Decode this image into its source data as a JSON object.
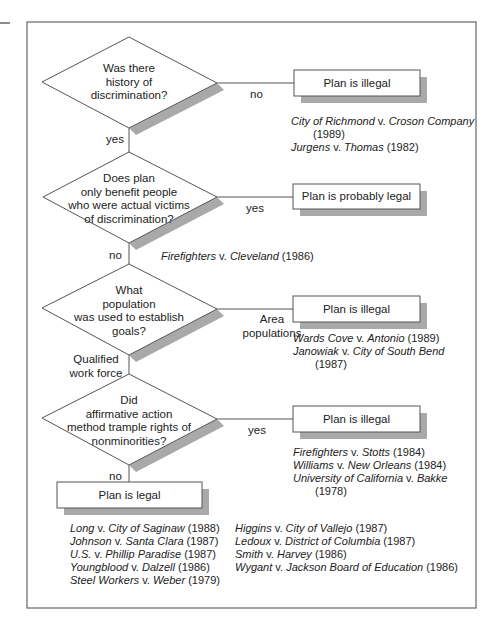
{
  "diagram": {
    "decisions": [
      {
        "id": "d1",
        "lines": [
          "Was there",
          "history of",
          "discrimination?"
        ]
      },
      {
        "id": "d2",
        "lines": [
          "Does plan",
          "only benefit people",
          "who were actual victims",
          "of discrimination?"
        ]
      },
      {
        "id": "d3",
        "lines": [
          "What",
          "population",
          "was used to establish",
          "goals?"
        ]
      },
      {
        "id": "d4",
        "lines": [
          "Did",
          "affirmative action",
          "method trample rights of",
          "nonminorities?"
        ]
      }
    ],
    "outcomes": [
      {
        "id": "o1",
        "label": "Plan is illegal"
      },
      {
        "id": "o2",
        "label": "Plan is probably  legal"
      },
      {
        "id": "o3",
        "label": "Plan is illegal"
      },
      {
        "id": "o4",
        "label": "Plan is illegal"
      },
      {
        "id": "o5",
        "label": "Plan is legal"
      }
    ],
    "edge_labels": {
      "d1_right": "no",
      "d1_down": "yes",
      "d2_right": "yes",
      "d2_down": "no",
      "d3_right": [
        "Area",
        "populations"
      ],
      "d3_down": [
        "Qualified",
        "work force"
      ],
      "d4_right": "yes",
      "d4_down": "no"
    },
    "cases": {
      "o1": [
        {
          "a": "City of Richmond",
          "v": " v. ",
          "b": "Croson Company",
          "year": " (1989)",
          "wrap_year": true
        },
        {
          "a": "Jurgens",
          "v": " v. ",
          "b": "Thomas",
          "year": " (1982)"
        }
      ],
      "d2_no": [
        {
          "a": "Firefighters",
          "v": " v. ",
          "b": "Cleveland",
          "year": " (1986)"
        }
      ],
      "o3": [
        {
          "a": "Wards Cove",
          "v": " v. ",
          "b": "Antonio",
          "year": " (1989)"
        },
        {
          "a": "Janowiak",
          "v": " v. ",
          "b": "City of South Bend",
          "year": " (1987)",
          "wrap_year": true
        }
      ],
      "o4": [
        {
          "a": "Firefighters",
          "v": " v. ",
          "b": "Stotts",
          "year": " (1984)"
        },
        {
          "a": "Williams",
          "v": " v. ",
          "b": "New Orleans",
          "year": " (1984)"
        },
        {
          "a": "University of California",
          "v": " v. ",
          "b": "Bakke",
          "year": " (1978)",
          "wrap_year": true
        }
      ],
      "o5_col1": [
        {
          "a": "Long",
          "v": " v. ",
          "b": "City of Saginaw",
          "year": " (1988)"
        },
        {
          "a": "Johnson",
          "v": " v. ",
          "b": "Santa Clara",
          "year": " (1987)"
        },
        {
          "a": "U.S.",
          "v": " v. ",
          "b": "Phillip Paradise",
          "year": " (1987)"
        },
        {
          "a": "Youngblood",
          "v": " v. ",
          "b": "Dalzell",
          "year": " (1986)"
        },
        {
          "a": "Steel Workers",
          "v": " v. ",
          "b": "Weber",
          "year": " (1979)"
        }
      ],
      "o5_col2": [
        {
          "a": "Higgins",
          "v": " v. ",
          "b": "City of Vallejo",
          "year": " (1987)"
        },
        {
          "a": "Ledoux",
          "v": " v. ",
          "b": "District of Columbia",
          "year": " (1987)"
        },
        {
          "a": "Smith",
          "v": " v. ",
          "b": "Harvey",
          "year": " (1986)"
        },
        {
          "a": "Wygant",
          "v": " v. ",
          "b": "Jackson Board of Education",
          "year": " (1986)"
        }
      ]
    },
    "colors": {
      "line": "#555555",
      "shadow": "#a9a9a9",
      "frame": "#666666",
      "fill": "#ffffff"
    }
  }
}
